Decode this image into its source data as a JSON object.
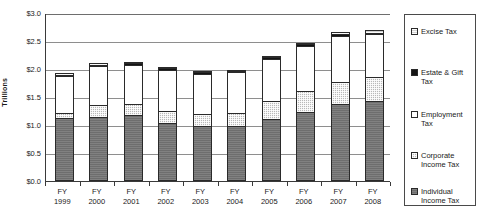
{
  "chart_data": {
    "type": "bar",
    "stacked": true,
    "title": "",
    "xlabel": "",
    "ylabel": "Trillions",
    "ylim": [
      0.0,
      3.0
    ],
    "ytick_step": 0.5,
    "ytick_labels": [
      "$3.0",
      "$2.5",
      "$2.0",
      "$1.5",
      "$1.0",
      "$0.5",
      "$0.0"
    ],
    "ytick_values": [
      3.0,
      2.5,
      2.0,
      1.5,
      1.0,
      0.5,
      0.0
    ],
    "grid": true,
    "legend_position": "right",
    "categories": [
      "FY\n1999",
      "FY\n2000",
      "FY\n2001",
      "FY\n2002",
      "FY\n2003",
      "FY\n2004",
      "FY\n2005",
      "FY\n2006",
      "FY\n2007",
      "FY\n2008"
    ],
    "category_lines": [
      [
        "FY",
        "1999"
      ],
      [
        "FY",
        "2000"
      ],
      [
        "FY",
        "2001"
      ],
      [
        "FY",
        "2002"
      ],
      [
        "FY",
        "2003"
      ],
      [
        "FY",
        "2004"
      ],
      [
        "FY",
        "2005"
      ],
      [
        "FY",
        "2006"
      ],
      [
        "FY",
        "2007"
      ],
      [
        "FY",
        "2008"
      ]
    ],
    "series": [
      {
        "name": "Individual Income Tax",
        "key": "individual",
        "fill": "dark-gray-solid",
        "color": "#6e6e6e",
        "values": [
          1.12,
          1.14,
          1.18,
          1.04,
          0.99,
          0.99,
          1.11,
          1.24,
          1.37,
          1.43
        ]
      },
      {
        "name": "Corporate Income Tax",
        "key": "corporate",
        "fill": "light-gray-checker",
        "color": "#b9b9b9",
        "values": [
          0.1,
          0.22,
          0.19,
          0.21,
          0.2,
          0.23,
          0.31,
          0.36,
          0.4,
          0.42
        ]
      },
      {
        "name": "Employment Tax",
        "key": "employment",
        "fill": "white",
        "color": "#ffffff",
        "values": [
          0.65,
          0.69,
          0.71,
          0.73,
          0.73,
          0.72,
          0.76,
          0.81,
          0.82,
          0.77
        ]
      },
      {
        "name": "Estate & Gift Tax",
        "key": "estate",
        "fill": "black-solid",
        "color": "#141414",
        "values": [
          0.03,
          0.03,
          0.03,
          0.03,
          0.02,
          0.02,
          0.03,
          0.03,
          0.03,
          0.03
        ]
      },
      {
        "name": "Excise Tax",
        "key": "excise",
        "fill": "very-light-gray",
        "color": "#d2d2d2",
        "values": [
          0.02,
          0.02,
          0.02,
          0.02,
          0.02,
          0.02,
          0.02,
          0.02,
          0.05,
          0.04
        ]
      }
    ],
    "totals": [
      1.92,
      2.1,
      2.13,
      2.03,
      1.96,
      1.98,
      2.23,
      2.46,
      2.67,
      2.69
    ]
  },
  "legend": {
    "items": [
      {
        "label": "Excise Tax",
        "key": "excise"
      },
      {
        "label": "Estate & Gift Tax",
        "key": "estate"
      },
      {
        "label": "Employment Tax",
        "key": "employment"
      },
      {
        "label": "Corporate Income Tax",
        "key": "corporate"
      },
      {
        "label": "Individual Income Tax",
        "key": "individual"
      }
    ]
  }
}
